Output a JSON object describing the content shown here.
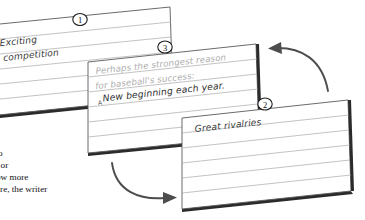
{
  "scene": {
    "background_color": "#ffffff",
    "rule_color": "#a9a9a9",
    "card_edge_color": "#5a5a5a",
    "shadow_color": "#2b2b2b",
    "arrow_color": "#4d4d4d"
  },
  "cards": [
    {
      "badge": "1",
      "name": "card-one",
      "lines": [
        {
          "text": "Exciting",
          "style": "dark"
        },
        {
          "text": "competition",
          "style": "dark"
        }
      ]
    },
    {
      "badge": "3",
      "name": "card-three",
      "lines": [
        {
          "text": "Perhaps the strongest reason",
          "style": "gray"
        },
        {
          "text": "for baseball's success:",
          "style": "gray"
        },
        {
          "text": "New beginning each year.",
          "style": "dark"
        }
      ],
      "insertion_mark": "A"
    },
    {
      "badge": "2",
      "name": "card-two",
      "lines": [
        {
          "text": "Great rivalries",
          "style": "dark"
        }
      ]
    }
  ],
  "arrows": [
    {
      "name": "arrow-card-two-to-card-three",
      "direction": "left"
    },
    {
      "name": "arrow-card-three-to-card-two",
      "direction": "right"
    }
  ],
  "body_text": {
    "lines": [
      "o",
      ", or",
      "ow more",
      "ere, the writer"
    ]
  }
}
